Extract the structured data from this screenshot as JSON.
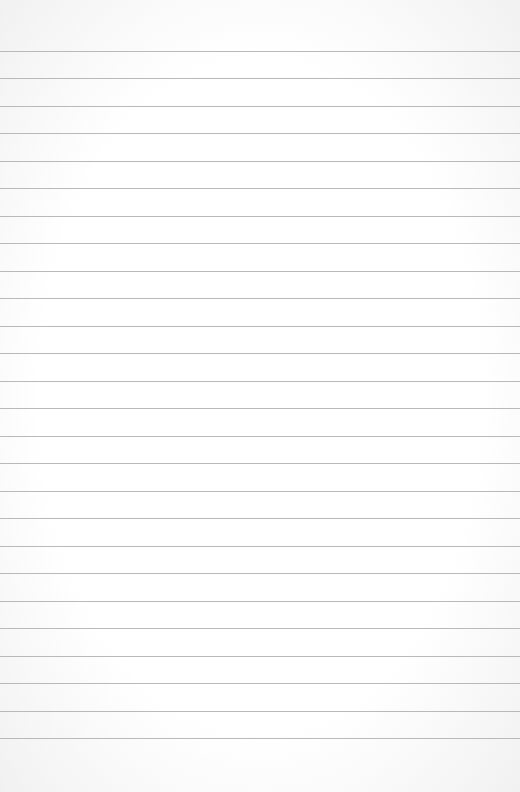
{
  "paper": {
    "type": "lined-notebook-paper",
    "background_color": "#ffffff",
    "line_color": "#b9b9b9",
    "line_count": 26,
    "first_line_y": 51,
    "line_spacing": 27.48
  }
}
